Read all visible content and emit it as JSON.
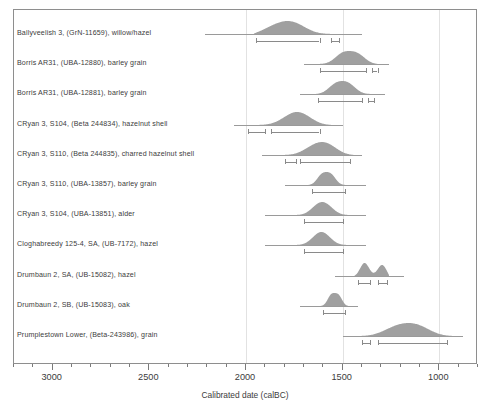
{
  "chart_data": {
    "type": "bar",
    "title": "",
    "xlabel": "Calibrated date (calBC)",
    "ylabel": "",
    "xlim": [
      3200,
      800
    ],
    "axis_direction": "reversed",
    "grid": "vertical gridlines at 2000, 1500, 1000 calBC",
    "legend": "none",
    "tick_labels": [
      "3000",
      "2500",
      "2000",
      "1500",
      "1000"
    ],
    "tick_values": [
      3000,
      2500,
      2000,
      1500,
      1000
    ],
    "minor_tick_interval": 100,
    "categories": [
      "Ballyveelish 3, (GrN-11659), willow/hazel",
      "Borris AR31, (UBA-12880), barley grain",
      "Borris AR31, (UBA-12881), barley grain",
      "CRyan 3, S104, (Beta 244834), hazelnut shell",
      "CRyan 3, S110, (Beta 244835), charred hazelnut shell",
      "CRyan 3, S110, (UBA-13857), barley grain",
      "CRyan 3, S104, (UBA-13851), alder",
      "Cloghabreedy 125-4, SA, (UB-7172), hazel",
      "Drumbaun 2, SA, (UB-15082), hazel",
      "Drumbaun 2, SB, (UB-15083), oak",
      "Prumplestown Lower, (Beta-243986), grain"
    ],
    "series": [
      {
        "name": "Ballyveelish 3, (GrN-11659), willow/hazel",
        "baseline_range": [
          2210,
          1400
        ],
        "distribution_range": [
          1960,
          1480
        ],
        "peaks": [
          1880,
          1800,
          1740
        ],
        "ranges_1sigma": [
          [
            1890,
            1740
          ]
        ],
        "ranges_2sigma": [
          [
            1950,
            1620
          ],
          [
            1560,
            1520
          ]
        ]
      },
      {
        "name": "Borris AR31, (UBA-12880), barley grain",
        "baseline_range": [
          1700,
          1260
        ],
        "distribution_range": [
          1640,
          1320
        ],
        "peaks": [
          1500,
          1420
        ],
        "ranges_1sigma": [
          [
            1520,
            1430
          ]
        ],
        "ranges_2sigma": [
          [
            1620,
            1380
          ],
          [
            1350,
            1320
          ]
        ]
      },
      {
        "name": "Borris AR31, (UBA-12881), barley grain",
        "baseline_range": [
          1720,
          1280
        ],
        "distribution_range": [
          1640,
          1340
        ],
        "peaks": [
          1540,
          1470
        ],
        "ranges_1sigma": [
          [
            1560,
            1450
          ]
        ],
        "ranges_2sigma": [
          [
            1630,
            1400
          ],
          [
            1370,
            1340
          ]
        ]
      },
      {
        "name": "CRyan 3, S104, (Beta 244834), hazelnut shell",
        "baseline_range": [
          2060,
          1500
        ],
        "distribution_range": [
          2020,
          1560
        ],
        "peaks": [
          1760,
          1700
        ],
        "ranges_1sigma": [
          [
            1780,
            1660
          ]
        ],
        "ranges_2sigma": [
          [
            1990,
            1900
          ],
          [
            1870,
            1620
          ]
        ]
      },
      {
        "name": "CRyan 3, S110, (Beta 244835), charred hazelnut shell",
        "baseline_range": [
          1920,
          1400
        ],
        "distribution_range": [
          1840,
          1440
        ],
        "peaks": [
          1660,
          1600,
          1560
        ],
        "ranges_1sigma": [
          [
            1680,
            1530
          ]
        ],
        "ranges_2sigma": [
          [
            1800,
            1740
          ],
          [
            1720,
            1460
          ]
        ]
      },
      {
        "name": "CRyan 3, S110, (UBA-13857), barley grain",
        "baseline_range": [
          1800,
          1380
        ],
        "distribution_range": [
          1680,
          1480
        ],
        "peaks": [
          1610,
          1560
        ],
        "ranges_1sigma": [
          [
            1620,
            1530
          ]
        ],
        "ranges_2sigma": [
          [
            1660,
            1490
          ]
        ]
      },
      {
        "name": "CRyan 3, S104, (UBA-13851), alder",
        "baseline_range": [
          1900,
          1380
        ],
        "distribution_range": [
          1760,
          1460
        ],
        "peaks": [
          1630,
          1580
        ],
        "ranges_1sigma": [
          [
            1650,
            1540
          ]
        ],
        "ranges_2sigma": [
          [
            1700,
            1500
          ]
        ]
      },
      {
        "name": "Cloghabreedy 125-4, SA, (UB-7172), hazel",
        "baseline_range": [
          1900,
          1380
        ],
        "distribution_range": [
          1760,
          1460
        ],
        "peaks": [
          1630,
          1590
        ],
        "ranges_1sigma": [
          [
            1650,
            1540
          ]
        ],
        "ranges_2sigma": [
          [
            1700,
            1500
          ]
        ]
      },
      {
        "name": "Drumbaun 2, SA, (UB-15082), hazel",
        "baseline_range": [
          1540,
          1180
        ],
        "distribution_range": [
          1440,
          1260
        ],
        "peaks": [
          1390,
          1290
        ],
        "ranges_1sigma": [
          [
            1410,
            1370
          ]
        ],
        "ranges_2sigma": [
          [
            1420,
            1360
          ],
          [
            1320,
            1270
          ]
        ]
      },
      {
        "name": "Drumbaun 2, SB, (UB-15083), oak",
        "baseline_range": [
          1720,
          1420
        ],
        "distribution_range": [
          1620,
          1470
        ],
        "peaks": [
          1560,
          1520
        ],
        "ranges_1sigma": [
          [
            1570,
            1520
          ]
        ],
        "ranges_2sigma": [
          [
            1600,
            1490
          ]
        ]
      },
      {
        "name": "Prumplestown Lower, (Beta-243986), grain",
        "baseline_range": [
          1500,
          880
        ],
        "distribution_range": [
          1420,
          930
        ],
        "peaks": [
          1250,
          1190,
          1130,
          1080
        ],
        "ranges_1sigma": [
          [
            1280,
            1020
          ]
        ],
        "ranges_2sigma": [
          [
            1400,
            1360
          ],
          [
            1320,
            960
          ]
        ]
      }
    ]
  },
  "axis": {
    "xtitle": "Calibrated date (calBC)",
    "labels": [
      "3000",
      "2500",
      "2000",
      "1500",
      "1000"
    ]
  },
  "colors": {
    "distribution_fill": "#a0a0a0",
    "baseline": "#9a9a9a",
    "frame": "#8e8e8e",
    "gridline": "#e2e2e2",
    "text": "#3c3c3c"
  }
}
